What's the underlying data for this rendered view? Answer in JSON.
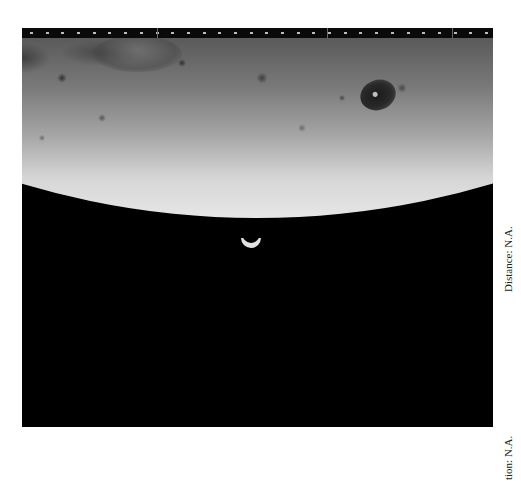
{
  "photo": {
    "subject": "Moon limb with Earth crescent",
    "elements": [
      "film-strip",
      "lunar-surface",
      "dark-crater",
      "earth-crescent"
    ]
  },
  "captions": {
    "distance": "Distance: N.A.",
    "location": "Location: N.A.",
    "location_visible": "tion: N.A."
  },
  "film_strip": {
    "tick_count": 30
  },
  "colors": {
    "background": "#ffffff",
    "space": "#000000",
    "lunar_highlight": "#e6e6e6",
    "lunar_shadow": "#5a5a5a",
    "caption_text": "#222222"
  }
}
